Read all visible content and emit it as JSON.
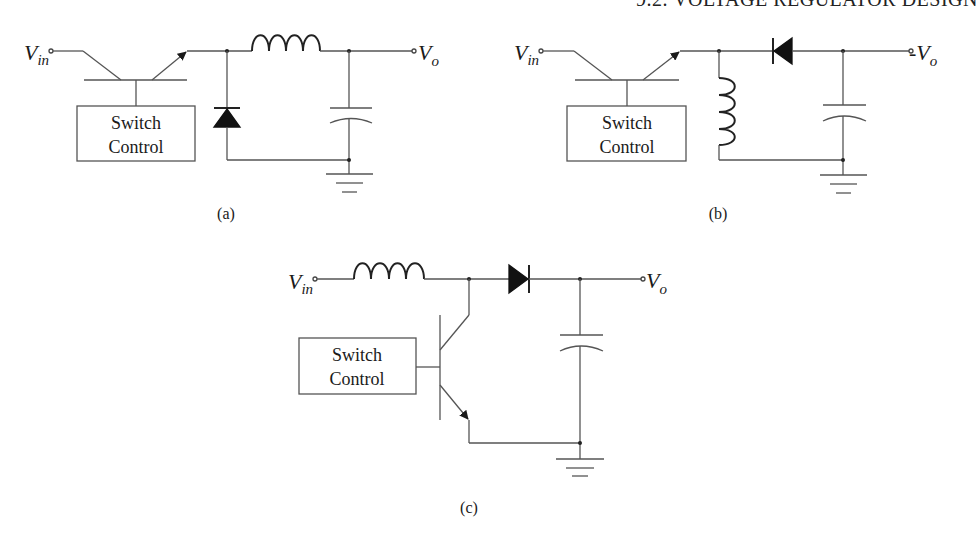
{
  "page": {
    "running_header": "9.2. VOLTAGE REGULATOR DESIGN"
  },
  "figures": [
    {
      "id": "a",
      "caption": "(a)",
      "description": "Buck (step-down) switching regulator",
      "input_label": {
        "main": "V",
        "sub": "in"
      },
      "output_label": {
        "prefix": "",
        "main": "V",
        "sub": "o"
      },
      "control_box": {
        "line1": "Switch",
        "line2": "Control"
      },
      "components": [
        "pass-transistor",
        "freewheel-diode",
        "series-inductor",
        "output-capacitor",
        "ground"
      ]
    },
    {
      "id": "b",
      "caption": "(b)",
      "description": "Inverting (buck-boost) switching regulator",
      "input_label": {
        "main": "V",
        "sub": "in"
      },
      "output_label": {
        "prefix": "-",
        "main": "V",
        "sub": "o"
      },
      "control_box": {
        "line1": "Switch",
        "line2": "Control"
      },
      "components": [
        "pass-transistor",
        "shunt-inductor",
        "series-diode",
        "output-capacitor",
        "ground"
      ]
    },
    {
      "id": "c",
      "caption": "(c)",
      "description": "Boost (step-up) switching regulator",
      "input_label": {
        "main": "V",
        "sub": "in"
      },
      "output_label": {
        "prefix": "",
        "main": "V",
        "sub": "o"
      },
      "control_box": {
        "line1": "Switch",
        "line2": "Control"
      },
      "components": [
        "series-inductor",
        "shunt-transistor",
        "series-diode",
        "output-capacitor",
        "ground"
      ]
    }
  ],
  "colors": {
    "ink": "#1a1a1a",
    "wire": "#555555",
    "background": "#ffffff"
  }
}
